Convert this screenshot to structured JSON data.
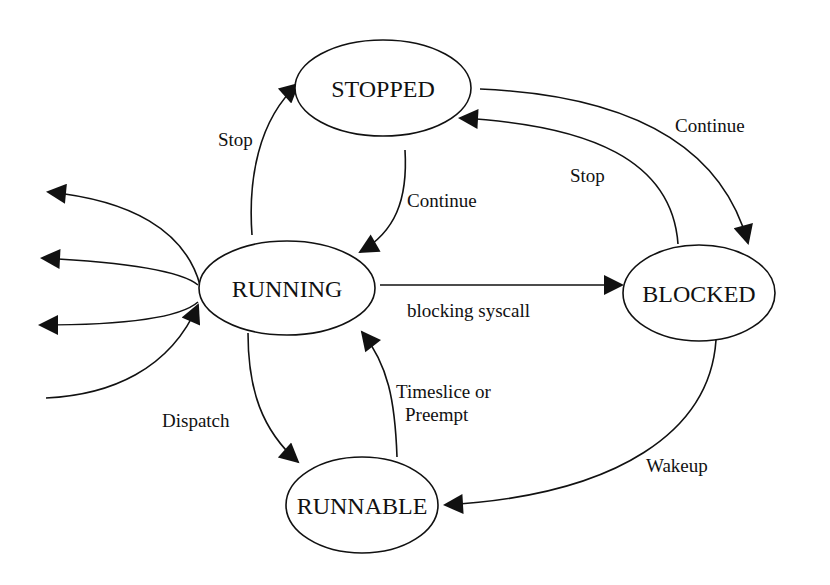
{
  "diagram": {
    "type": "state-transition",
    "states": [
      {
        "id": "stopped",
        "label": "STOPPED"
      },
      {
        "id": "running",
        "label": "RUNNING"
      },
      {
        "id": "blocked",
        "label": "BLOCKED"
      },
      {
        "id": "runnable",
        "label": "RUNNABLE"
      }
    ],
    "transitions": [
      {
        "id": "running-stopped",
        "from": "running",
        "to": "stopped",
        "label": "Stop"
      },
      {
        "id": "stopped-running",
        "from": "stopped",
        "to": "running",
        "label": "Continue"
      },
      {
        "id": "stopped-blocked",
        "from": "stopped",
        "to": "blocked",
        "label": "Continue"
      },
      {
        "id": "blocked-stopped",
        "from": "blocked",
        "to": "stopped",
        "label": "Stop"
      },
      {
        "id": "running-blocked",
        "from": "running",
        "to": "blocked",
        "label": "blocking syscall"
      },
      {
        "id": "running-runnable",
        "from": "running",
        "to": "runnable",
        "label": "Dispatch"
      },
      {
        "id": "runnable-running",
        "from": "runnable",
        "to": "running",
        "label_lines": [
          "Timeslice or",
          "Preempt"
        ]
      },
      {
        "id": "blocked-runnable",
        "from": "blocked",
        "to": "runnable",
        "label": "Wakeup"
      },
      {
        "id": "running-exit-1",
        "from": "running",
        "to": "external",
        "label": ""
      },
      {
        "id": "running-exit-2",
        "from": "running",
        "to": "external",
        "label": ""
      },
      {
        "id": "running-exit-3",
        "from": "running",
        "to": "external",
        "label": ""
      },
      {
        "id": "external-running",
        "from": "external",
        "to": "running",
        "label": ""
      }
    ]
  }
}
